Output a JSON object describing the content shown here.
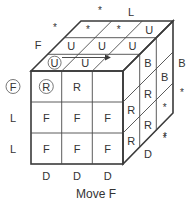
{
  "caption": "Move F",
  "colors": {
    "stroke": "#3a3a3a",
    "text": "#333333",
    "background": "#ffffff"
  },
  "front_face": {
    "rows": [
      [
        "R",
        "R",
        ""
      ],
      [
        "F",
        "F",
        "F"
      ],
      [
        "F",
        "F",
        "F"
      ]
    ],
    "circled": [
      [
        0,
        0
      ]
    ]
  },
  "top_face": {
    "rows_front_to_back": [
      [
        "U",
        "U",
        ""
      ],
      [
        "U",
        "U",
        "U"
      ],
      [
        "*",
        "*",
        "U"
      ]
    ],
    "circled": [
      [
        0,
        0
      ]
    ],
    "arrow": "right"
  },
  "right_face": {
    "rows": [
      [
        "",
        "B",
        ""
      ],
      [
        "R",
        "R",
        "*"
      ],
      [
        "R",
        "R",
        "*"
      ]
    ]
  },
  "outer_labels": {
    "left": [
      "F",
      "L",
      "L"
    ],
    "left_circled": [
      0
    ],
    "bottom": [
      "D",
      "D",
      "D"
    ],
    "top_left": "F",
    "top_back": [
      "*",
      "*",
      "L"
    ],
    "right_back": [
      "B",
      "*",
      "*"
    ],
    "right_bottom": "D"
  }
}
